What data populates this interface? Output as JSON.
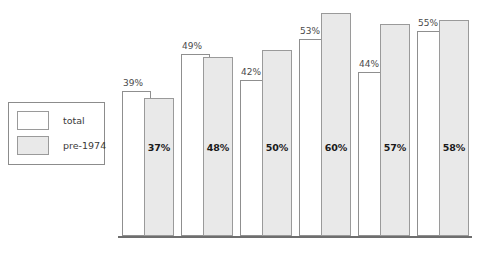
{
  "chart_data": {
    "type": "bar",
    "title": "",
    "subtitle": "",
    "xlabel": "",
    "ylabel": "",
    "ylim": [
      0,
      62
    ],
    "grid": false,
    "legend_position": "left",
    "categories": [
      "24 Mar",
      "27 Mar",
      "28 Mar",
      "29 Mar",
      "30 Mar",
      "31 Mar"
    ],
    "series": [
      {
        "name": "total",
        "color": "#ffffff",
        "values": [
          39,
          49,
          42,
          53,
          44,
          55
        ],
        "labels": [
          "39%",
          "49%",
          "42%",
          "53%",
          "44%",
          "55%"
        ]
      },
      {
        "name": "pre-1974",
        "color": "#e9e9e9",
        "values": [
          37,
          48,
          50,
          60,
          57,
          58
        ],
        "labels": [
          "37%",
          "48%",
          "50%",
          "60%",
          "57%",
          "58%"
        ]
      }
    ]
  },
  "legend": {
    "items": [
      {
        "label": "total",
        "color": "#ffffff"
      },
      {
        "label": "pre-1974",
        "color": "#e9e9e9"
      }
    ]
  },
  "axis": {
    "ticks": [
      "24 Mar",
      "27 Mar",
      "28 Mar",
      "29 Mar",
      "30 Mar",
      "31 Mar"
    ]
  },
  "groups": [
    {
      "tick": "24 Mar",
      "total_label": "39%",
      "pre1974_label": "37%",
      "total_value": 39,
      "pre1974_value": 37
    },
    {
      "tick": "27 Mar",
      "total_label": "49%",
      "pre1974_label": "48%",
      "total_value": 49,
      "pre1974_value": 48
    },
    {
      "tick": "28 Mar",
      "total_label": "42%",
      "pre1974_label": "50%",
      "total_value": 42,
      "pre1974_value": 50
    },
    {
      "tick": "29 Mar",
      "total_label": "53%",
      "pre1974_label": "60%",
      "total_value": 53,
      "pre1974_value": 60
    },
    {
      "tick": "30 Mar",
      "total_label": "44%",
      "pre1974_label": "57%",
      "total_value": 44,
      "pre1974_value": 57
    },
    {
      "tick": "31 Mar",
      "total_label": "55%",
      "pre1974_label": "58%",
      "total_value": 55,
      "pre1974_value": 58
    }
  ],
  "layout": {
    "plot_left": 122,
    "group_pitch": 59,
    "baseline_y": 236,
    "px_per_percent": 3.72
  }
}
